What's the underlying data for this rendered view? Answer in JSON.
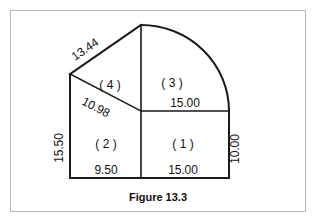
{
  "figure": {
    "caption": "Figure 13.3",
    "regions": [
      {
        "id": "region-1",
        "label": "( 1 )"
      },
      {
        "id": "region-2",
        "label": "( 2 )"
      },
      {
        "id": "region-3",
        "label": "( 3 )"
      },
      {
        "id": "region-4",
        "label": "( 4 )"
      }
    ],
    "dimensions": {
      "top_slant": "13.44",
      "inner_diagonal": "10.98",
      "left_vertical": "15.50",
      "right_vertical": "10.00",
      "middle_horizontal": "15.00",
      "bottom_left": "9.50",
      "bottom_right": "15.00"
    },
    "colors": {
      "outline": "#1a1a1a",
      "panel_border": "#b9b9b9",
      "background": "#ffffff",
      "text": "#121212"
    }
  }
}
